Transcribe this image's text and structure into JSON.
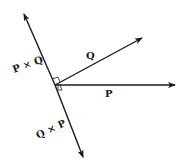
{
  "diagram": {
    "type": "vector cross product",
    "colors": {
      "line": "#1a1a1a",
      "background": "#ffffff"
    },
    "origin": [
      55,
      85
    ],
    "vectors": [
      {
        "id": "P",
        "label": "P",
        "tip": [
          176,
          85
        ]
      },
      {
        "id": "Q",
        "label": "Q",
        "tip": [
          143,
          37
        ]
      },
      {
        "id": "PxQ",
        "label": "P × Q",
        "tip": [
          24,
          13
        ]
      },
      {
        "id": "QxP",
        "label": "Q × P",
        "tip": [
          83,
          158
        ]
      }
    ],
    "right_angle_markers": 2
  }
}
